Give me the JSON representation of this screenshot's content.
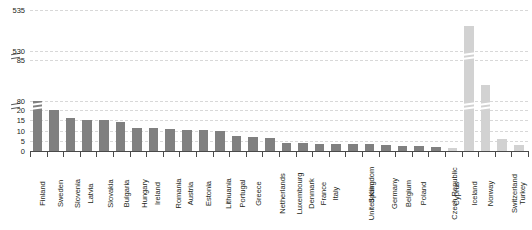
{
  "chart_data": {
    "type": "bar",
    "title": "",
    "subtitle": "",
    "xlabel": "",
    "ylabel": "",
    "grid": true,
    "legend": null,
    "axis_broken": true,
    "ylim": [
      0,
      535
    ],
    "y_segments": [
      {
        "from": 0,
        "to": 20,
        "ticks": [
          0,
          5,
          10,
          15,
          20
        ]
      },
      {
        "from": 80,
        "to": 85,
        "ticks": [
          80,
          85
        ]
      },
      {
        "from": 530,
        "to": 535,
        "ticks": [
          530,
          535
        ]
      }
    ],
    "y_ticks": [
      "535",
      "530",
      "85",
      "80",
      "20",
      "15",
      "10",
      "5",
      "0"
    ],
    "categories": [
      "Finland",
      "Sweden",
      "Slovenia",
      "Latvia",
      "Slovakia",
      "Bulgaria",
      "Hungary",
      "Ireland",
      "Romania",
      "Austria",
      "Estonia",
      "Lithuania",
      "Portugal",
      "Greece",
      "Netherlands",
      "Luxembourg",
      "Denmark",
      "France",
      "Italy",
      "United Kingdom",
      "Spain",
      "Germany",
      "Belgium",
      "Poland",
      "Czech Republic",
      "Cyprus",
      "Iceland",
      "Norway",
      "Switzerland",
      "Turkey"
    ],
    "values": [
      20.5,
      19.8,
      16.2,
      15.3,
      15.1,
      14.2,
      11.4,
      11.0,
      10.6,
      10.4,
      10.2,
      9.6,
      7.2,
      6.8,
      6.4,
      4.0,
      3.7,
      3.5,
      3.4,
      3.3,
      3.2,
      2.9,
      2.6,
      2.4,
      2.1,
      1.5,
      533.0,
      82.0,
      6.0,
      3.0
    ],
    "series_groups": [
      {
        "name": "member-states",
        "color": "#808080",
        "categories": [
          "Finland",
          "Sweden",
          "Slovenia",
          "Latvia",
          "Slovakia",
          "Bulgaria",
          "Hungary",
          "Ireland",
          "Romania",
          "Austria",
          "Estonia",
          "Lithuania",
          "Portugal",
          "Greece",
          "Netherlands",
          "Luxembourg",
          "Denmark",
          "France",
          "Italy",
          "United Kingdom",
          "Spain",
          "Germany",
          "Belgium",
          "Poland",
          "Czech Republic"
        ]
      },
      {
        "name": "other-countries",
        "color": "#d2d2d2",
        "categories": [
          "Cyprus",
          "Iceland",
          "Norway",
          "Switzerland",
          "Turkey"
        ]
      }
    ],
    "colors": {
      "bar_dark": "#808080",
      "bar_light": "#d2d2d2",
      "grid": "#d8d8d8",
      "axis": "#4a4a4a",
      "text": "#231f20"
    }
  }
}
